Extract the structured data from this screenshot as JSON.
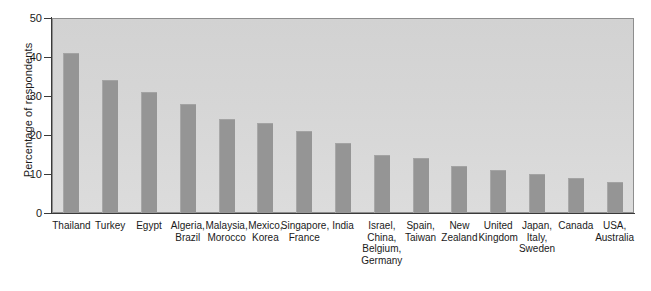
{
  "chart_data": {
    "type": "bar",
    "title": "",
    "subtitle": "",
    "xlabel": "",
    "ylabel": "Percentage of respondents",
    "ylim": [
      0,
      50
    ],
    "yticks": [
      0,
      10,
      20,
      30,
      40,
      50
    ],
    "grid": false,
    "legend": null,
    "categories": [
      "Thailand",
      "Turkey",
      "Egypt",
      "Algeria,\nBrazil",
      "Malaysia,\nMorocco",
      "Mexico,\nKorea",
      "Singapore,\nFrance",
      "India",
      "Israel,\nChina,\nBelgium,\nGermany",
      "Spain,\nTaiwan",
      "New\nZealand",
      "United\nKingdom",
      "Japan,\nItaly,\nSweden",
      "Canada",
      "USA,\nAustralia"
    ],
    "values": [
      41,
      34,
      31,
      28,
      24,
      23,
      21,
      18,
      15,
      14,
      12,
      11,
      10,
      9,
      8
    ],
    "colors": {
      "bar": "#959595",
      "plot_background": "#d6d6d6",
      "axis": "#3a3a3a",
      "text": "#1a1a1a",
      "page_background": "#ffffff"
    }
  }
}
